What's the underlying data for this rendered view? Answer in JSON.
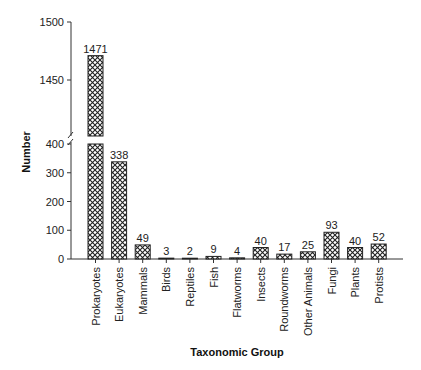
{
  "chart_data": {
    "type": "bar",
    "title": "",
    "xlabel": "Taxonomic Group",
    "ylabel": "Number",
    "categories": [
      "Prokaryotes",
      "Eukaryotes",
      "Mammals",
      "Birds",
      "Reptiles",
      "Fish",
      "Flatworms",
      "Insects",
      "Roundworms",
      "Other Animals",
      "Fungi",
      "Plants",
      "Protists"
    ],
    "values": [
      1471,
      338,
      49,
      3,
      2,
      9,
      4,
      40,
      17,
      25,
      93,
      40,
      52
    ],
    "data_labels": [
      "1471",
      "338",
      "49",
      "3",
      "2",
      "9",
      "4",
      "40",
      "17",
      "25",
      "93",
      "40",
      "52"
    ],
    "y_axis_break": {
      "lower_range": [
        0,
        400
      ],
      "upper_range": [
        1400,
        1500
      ]
    },
    "yticks_lower": [
      0,
      100,
      200,
      300,
      400
    ],
    "yticks_upper": [
      1450,
      1500
    ],
    "ytick_labels": [
      "0",
      "100",
      "200",
      "300",
      "400",
      "1450",
      "1500"
    ],
    "grid": false,
    "legend": null,
    "bar_pattern": "crosshatch",
    "colors": {
      "bar_fill": "#ffffff",
      "hatch": "#222222",
      "axis": "#333333"
    }
  }
}
